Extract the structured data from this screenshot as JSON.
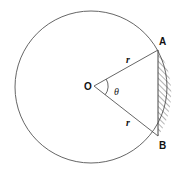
{
  "diagram": {
    "labels": {
      "center": "O",
      "point_a": "A",
      "point_b": "B",
      "radius_top": "r",
      "radius_bottom": "r",
      "angle": "θ"
    },
    "colors": {
      "stroke": "#555555",
      "hatch": "#444444",
      "text": "#111111"
    },
    "shaded_region": "circular segment between chord AB and arc AB"
  }
}
